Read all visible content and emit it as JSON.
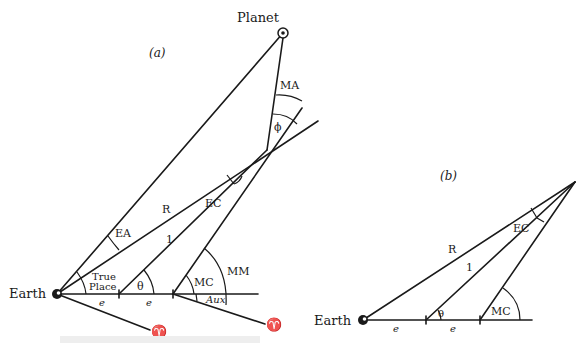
{
  "diagram_a": {
    "panel_label": "(a)",
    "planet_label": "Planet",
    "earth_label": "Earth",
    "line_labels": {
      "R": "R",
      "one": "1",
      "e1": "e",
      "e2": "e"
    },
    "angle_labels": {
      "MA": "MA",
      "phi": "ϕ",
      "EC": "EC",
      "EA": "EA",
      "true_place_line1": "True",
      "true_place_line2": "Place",
      "theta": "θ",
      "MC": "MC",
      "MM": "MM",
      "Aux": "Aux"
    },
    "aries_symbol_1": "♈",
    "aries_symbol_2": "♈"
  },
  "diagram_b": {
    "panel_label": "(b)",
    "earth_label": "Earth",
    "line_labels": {
      "R": "R",
      "one": "1",
      "e1": "e",
      "e2": "e"
    },
    "angle_labels": {
      "EC": "EC",
      "theta": "θ",
      "MC": "MC"
    }
  }
}
